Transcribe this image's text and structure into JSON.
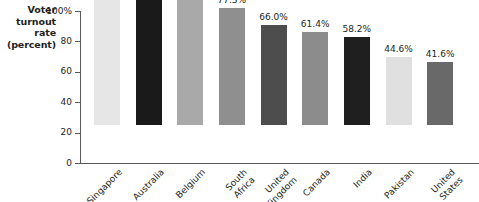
{
  "chart_data": {
    "type": "bar",
    "title": "",
    "subtitle": "",
    "xlabel": "",
    "ylabel": "Voter turnout rate (percent)",
    "ylim": [
      0,
      100
    ],
    "grid": false,
    "legend": "none",
    "orientation": "vertical",
    "categories": [
      "Singapore",
      "Australia",
      "Belgium",
      "South Africa",
      "United Kingdom",
      "Canada",
      "India",
      "Pakistan",
      "United States"
    ],
    "values": [
      93.2,
      93.2,
      89.2,
      77.3,
      66.0,
      61.4,
      58.2,
      44.6,
      41.6
    ],
    "value_labels": [
      "93.2%",
      "93.2%",
      "89.2%",
      "77.3%",
      "66.0%",
      "61.4%",
      "58.2%",
      "44.6%",
      "41.6%"
    ],
    "bar_colors": [
      "#e6e6e6",
      "#1a1a1a",
      "#a9a9a9",
      "#8f8f8f",
      "#4d4d4d",
      "#8c8c8c",
      "#1f1f1f",
      "#e0e0e0",
      "#696969"
    ],
    "y_ticks": [
      {
        "value": 100,
        "label": "100%"
      },
      {
        "value": 80,
        "label": "80"
      },
      {
        "value": 60,
        "label": "60"
      },
      {
        "value": 40,
        "label": "40"
      },
      {
        "value": 20,
        "label": "20"
      },
      {
        "value": 0,
        "label": "0"
      }
    ],
    "axis_color": "#58595b",
    "text_color": "#231f20",
    "background": "#ffffff"
  },
  "axis_title": {
    "line1": "Voter",
    "line2": "turnout",
    "line3": "rate",
    "line4": "(percent)"
  },
  "category_label_lines": [
    [
      "Singapore"
    ],
    [
      "Australia"
    ],
    [
      "Belgium"
    ],
    [
      "South",
      "Africa"
    ],
    [
      "United",
      "Kingdom"
    ],
    [
      "Canada"
    ],
    [
      "India"
    ],
    [
      "Pakistan"
    ],
    [
      "United",
      "States"
    ]
  ]
}
